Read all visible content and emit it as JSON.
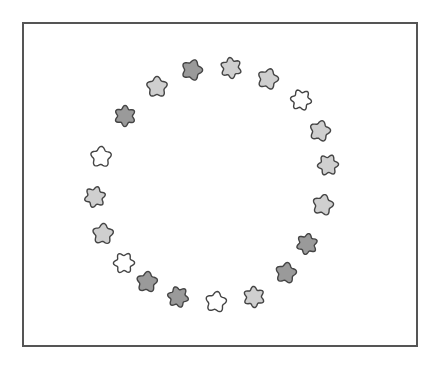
{
  "figure": {
    "frame": {
      "x": 22,
      "y": 22,
      "width": 396,
      "height": 325,
      "color": "#555555"
    },
    "fills": {
      "dark": "#9a9a9a",
      "light": "#cfcfcf",
      "white": "#ffffff"
    },
    "stroke": "#444444",
    "shapes": [
      {
        "x": 192,
        "y": 70,
        "fill": "dark"
      },
      {
        "x": 231,
        "y": 68,
        "fill": "light"
      },
      {
        "x": 268,
        "y": 79,
        "fill": "light"
      },
      {
        "x": 301,
        "y": 100,
        "fill": "white"
      },
      {
        "x": 320,
        "y": 131,
        "fill": "light"
      },
      {
        "x": 328,
        "y": 165,
        "fill": "light"
      },
      {
        "x": 323,
        "y": 205,
        "fill": "light"
      },
      {
        "x": 307,
        "y": 244,
        "fill": "dark"
      },
      {
        "x": 286,
        "y": 273,
        "fill": "dark"
      },
      {
        "x": 254,
        "y": 297,
        "fill": "light"
      },
      {
        "x": 216,
        "y": 302,
        "fill": "white"
      },
      {
        "x": 178,
        "y": 297,
        "fill": "dark"
      },
      {
        "x": 147,
        "y": 282,
        "fill": "dark"
      },
      {
        "x": 124,
        "y": 263,
        "fill": "white"
      },
      {
        "x": 103,
        "y": 234,
        "fill": "light"
      },
      {
        "x": 95,
        "y": 197,
        "fill": "light"
      },
      {
        "x": 101,
        "y": 157,
        "fill": "white"
      },
      {
        "x": 125,
        "y": 116,
        "fill": "dark"
      },
      {
        "x": 157,
        "y": 87,
        "fill": "light"
      }
    ]
  }
}
